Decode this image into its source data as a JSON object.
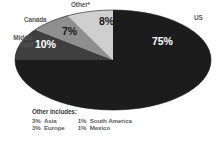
{
  "chart_data": {
    "type": "pie",
    "title": "",
    "categories": [
      "US",
      "Middle East",
      "Canada",
      "Other*"
    ],
    "values": [
      75,
      10,
      7,
      8
    ],
    "value_labels": [
      "75%",
      "10%",
      "7%",
      "8%"
    ],
    "colors": [
      "#1c1c1c",
      "#3f3f3f",
      "#8f8f8f",
      "#cfcfcf"
    ],
    "legend_position": "outside-labels",
    "grid": false,
    "footnote": {
      "title": "Other includes:",
      "items": [
        {
          "pct": "3%",
          "name": "Asia"
        },
        {
          "pct": "1%",
          "name": "South America"
        },
        {
          "pct": "3%",
          "name": "Europe"
        },
        {
          "pct": "1%",
          "name": "Mexico"
        }
      ]
    }
  },
  "labels": {
    "us": "US",
    "middle_east": "Middle\nEast",
    "canada": "Canada",
    "other": "Other*"
  },
  "percents": {
    "us": "75%",
    "middle_east": "10%",
    "canada": "7%",
    "other": "8%"
  },
  "footnote": {
    "title": "Other includes:",
    "asia_pct": "3%",
    "asia_name": "Asia",
    "south_america_pct": "1%",
    "south_america_name": "South America",
    "europe_pct": "3%",
    "europe_name": "Europe",
    "mexico_pct": "1%",
    "mexico_name": "Mexico"
  }
}
